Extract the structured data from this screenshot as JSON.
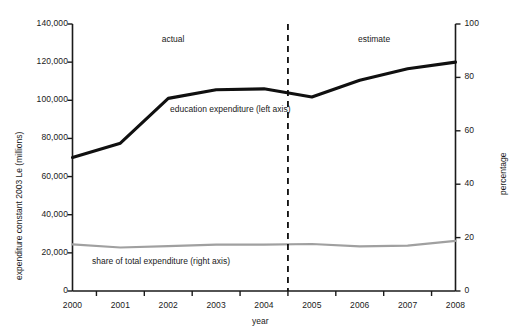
{
  "chart_data": {
    "type": "line",
    "title": "",
    "xlabel": "year",
    "ylabel": "expenditure constant 2003 Le (millions)",
    "y2label": "percentage",
    "categories": [
      "2000",
      "2001",
      "2002",
      "2003",
      "2004",
      "2005",
      "2006",
      "2007",
      "2008"
    ],
    "x": [
      2000,
      2001,
      2002,
      2003,
      2004,
      2005,
      2006,
      2007,
      2008
    ],
    "ylim": [
      0,
      140000
    ],
    "y2lim": [
      0,
      100
    ],
    "yticks": [
      "0",
      "20,000",
      "40,000",
      "60,000",
      "80,000",
      "100,000",
      "120,000",
      "140,000"
    ],
    "ytick_values": [
      0,
      20000,
      40000,
      60000,
      80000,
      100000,
      120000,
      140000
    ],
    "y2ticks": [
      "0",
      "20",
      "40",
      "60",
      "80",
      "100"
    ],
    "y2tick_values": [
      0,
      20,
      40,
      60,
      80,
      100
    ],
    "xticks": [
      "2000",
      "2001",
      "2002",
      "2003",
      "2004",
      "2005",
      "2006",
      "2007",
      "2008"
    ],
    "grid": false,
    "legend_position": "inline-labels",
    "series": [
      {
        "name": "education expenditure (left axis)",
        "axis": "left",
        "color": "#101010",
        "values": [
          70000,
          77500,
          101000,
          105500,
          106000,
          101700,
          110500,
          116500,
          120000
        ]
      },
      {
        "name": "share of total expenditure (right axis)",
        "axis": "right",
        "color": "#a0a0a0",
        "values": [
          17.5,
          16.3,
          16.8,
          17.4,
          17.4,
          17.6,
          16.7,
          17.0,
          18.8
        ]
      }
    ],
    "annotations": [
      {
        "text": "actual",
        "x": 2002.1,
        "y_frac": 0.945
      },
      {
        "text": "estimate",
        "x": 2006.3,
        "y_frac": 0.945
      }
    ],
    "divider": {
      "x": 2004.5,
      "style": "dashed",
      "label": ""
    }
  }
}
